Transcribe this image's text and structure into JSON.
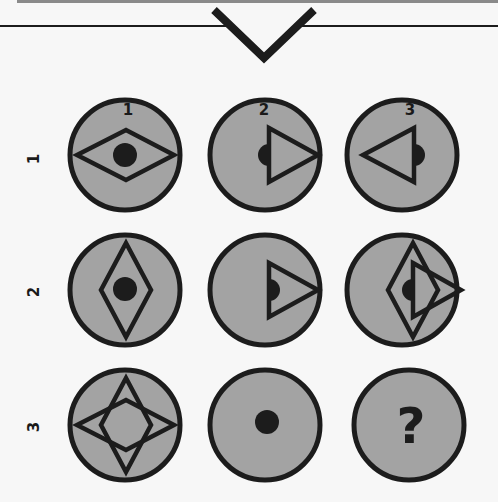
{
  "puzzle": {
    "column_labels": [
      "1",
      "2",
      "3"
    ],
    "row_labels": [
      "1",
      "2",
      "3"
    ],
    "colors": {
      "background": "#f7f7f7",
      "circle_fill": "#a3a3a3",
      "stroke": "#1c1c1c",
      "top_bar": "#8a8a8a"
    },
    "cells": [
      {
        "row": 1,
        "col": 1,
        "content": "horizontal-diamond-with-center-dot"
      },
      {
        "row": 1,
        "col": 2,
        "content": "right-pointing-triangle-with-half-dot"
      },
      {
        "row": 1,
        "col": 3,
        "content": "left-pointing-triangle-with-half-dot"
      },
      {
        "row": 2,
        "col": 1,
        "content": "vertical-diamond-with-center-dot"
      },
      {
        "row": 2,
        "col": 2,
        "content": "right-pointing-triangle-with-half-dot"
      },
      {
        "row": 2,
        "col": 3,
        "content": "vertical-diamond-and-right-triangle-with-half-dot"
      },
      {
        "row": 3,
        "col": 1,
        "content": "four-point-star"
      },
      {
        "row": 3,
        "col": 2,
        "content": "center-dot"
      },
      {
        "row": 3,
        "col": 3,
        "content": "question-mark"
      }
    ],
    "unknown_cell_symbol": "?"
  }
}
